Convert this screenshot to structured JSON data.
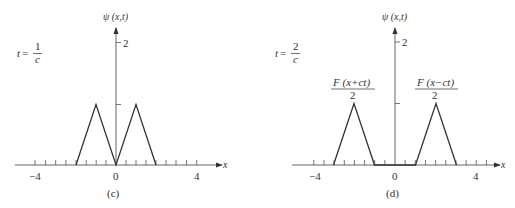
{
  "figure": {
    "panels": [
      {
        "id": "c",
        "caption": "(c)",
        "time_label": {
          "t": "t",
          "eq": "=",
          "num": "1",
          "den": "c"
        },
        "y_axis_label": "ψ (x,t)",
        "x_axis_label": "x",
        "y_tick_label": "2",
        "x_tick_labels": [
          "−4",
          "0",
          "4"
        ],
        "curve_points": [
          [
            -2,
            0
          ],
          [
            -1,
            1
          ],
          [
            0,
            0
          ],
          [
            1,
            1
          ],
          [
            2,
            0
          ]
        ]
      },
      {
        "id": "d",
        "caption": "(d)",
        "time_label": {
          "t": "t",
          "eq": "=",
          "num": "2",
          "den": "c"
        },
        "y_axis_label": "ψ (x,t)",
        "x_axis_label": "x",
        "y_tick_label": "2",
        "x_tick_labels": [
          "−4",
          "0",
          "4"
        ],
        "curve_points": [
          [
            -3,
            0
          ],
          [
            -2,
            1
          ],
          [
            -1,
            0
          ],
          [
            1,
            0
          ],
          [
            2,
            1
          ],
          [
            3,
            0
          ]
        ],
        "annotations": [
          {
            "num": "F (x+ct)",
            "den": "2"
          },
          {
            "num": "F (x−ct)",
            "den": "2"
          }
        ]
      }
    ]
  }
}
